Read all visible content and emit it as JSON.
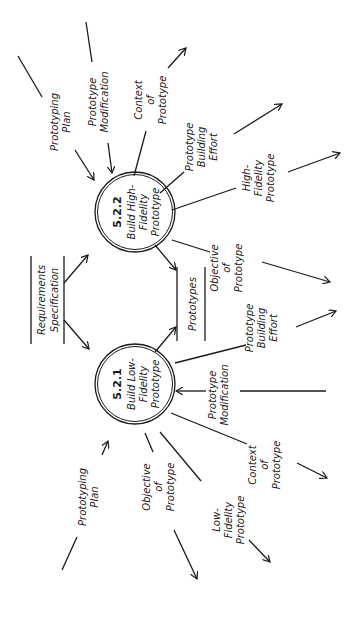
{
  "diagram": {
    "type": "data-flow-diagram",
    "orientation": "rotated-90-ccw",
    "processes": [
      {
        "id": "5.2.2",
        "number": "5.2.2",
        "line1": "Build High-",
        "line2": "Fidelity",
        "line3": "Prototype"
      },
      {
        "id": "5.2.1",
        "number": "5.2.1",
        "line1": "Build Low-",
        "line2": "Fidelity",
        "line3": "Prototype"
      }
    ],
    "data_stores": {
      "requirements": {
        "line1": "Requirements",
        "line2": "Specification"
      },
      "prototypes": {
        "line1": "Prototypes"
      }
    },
    "flows_high": {
      "prototyping_plan": {
        "line1": "Prototyping",
        "line2": "Plan"
      },
      "prototype_modification": {
        "line1": "Prototype",
        "line2": "Modification"
      },
      "context_of_prototype": {
        "line1": "Context",
        "line2": "of",
        "line3": "Prototype"
      },
      "prototype_building_effort": {
        "line1": "Prototype",
        "line2": "Building",
        "line3": "Effort"
      },
      "high_fidelity_prototype": {
        "line1": "High-",
        "line2": "Fidelity",
        "line3": "Prototype"
      },
      "objective_of_prototype": {
        "line1": "Objective",
        "line2": "of",
        "line3": "Prototype"
      }
    },
    "flows_low": {
      "prototyping_plan": {
        "line1": "Prototyping",
        "line2": "Plan"
      },
      "objective_of_prototype": {
        "line1": "Objective",
        "line2": "of",
        "line3": "Prototype"
      },
      "low_fidelity_prototype": {
        "line1": "Low-",
        "line2": "Fidelity",
        "line3": "Prototype"
      },
      "context_of_prototype": {
        "line1": "Context",
        "line2": "of",
        "line3": "Prototype"
      },
      "prototype_modification": {
        "line1": "Prototype",
        "line2": "Modification"
      },
      "prototype_building_effort": {
        "line1": "Prototype",
        "line2": "Building",
        "line3": "Effort"
      }
    },
    "colors": {
      "ink": "#1a1a1a",
      "background": "#ffffff"
    }
  }
}
